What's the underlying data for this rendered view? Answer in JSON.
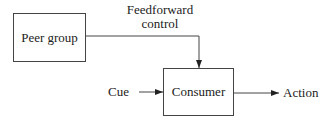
{
  "diagram": {
    "nodes": {
      "peer_group": "Peer group",
      "consumer": "Consumer"
    },
    "labels": {
      "feedforward_line1": "Feedforward",
      "feedforward_line2": "control",
      "cue": "Cue",
      "action": "Action"
    },
    "edges": [
      {
        "from": "Peer group",
        "to": "Consumer",
        "label": "Feedforward control"
      },
      {
        "from": "Cue",
        "to": "Consumer"
      },
      {
        "from": "Consumer",
        "to": "Action"
      }
    ]
  }
}
